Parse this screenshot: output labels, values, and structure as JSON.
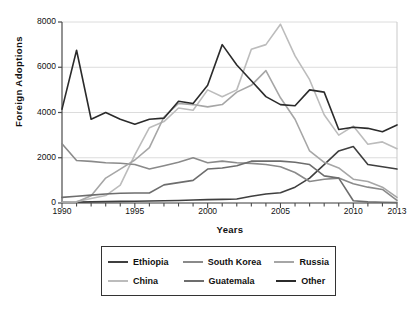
{
  "chart_data": {
    "type": "line",
    "title": "",
    "xlabel": "Years",
    "ylabel": "Foreign  Adoptions",
    "xlim": [
      1990,
      2013
    ],
    "ylim": [
      0,
      8000
    ],
    "ytick_values": [
      0,
      2000,
      4000,
      6000,
      8000
    ],
    "ytick_labels": [
      "0",
      "2000",
      "4000",
      "6000",
      "8000"
    ],
    "xtick_values": [
      1990,
      1995,
      2000,
      2005,
      2010,
      2013
    ],
    "xtick_labels": [
      "1990",
      "1995",
      "2000",
      "2005",
      "2010",
      "2013"
    ],
    "minor_xticks_every": 1,
    "grid": "horizontal",
    "legend_position": "below-center",
    "legend_columns": 3,
    "x": [
      1990,
      1991,
      1992,
      1993,
      1994,
      1995,
      1996,
      1997,
      1998,
      1999,
      2000,
      2001,
      2002,
      2003,
      2004,
      2005,
      2006,
      2007,
      2008,
      2009,
      2010,
      2011,
      2012,
      2013
    ],
    "series": [
      {
        "name": "Ethiopia",
        "color": "#3f3f3f",
        "values": [
          30,
          40,
          50,
          60,
          70,
          80,
          90,
          100,
          110,
          130,
          150,
          160,
          180,
          300,
          400,
          450,
          700,
          1100,
          1700,
          2300,
          2500,
          1700,
          1600,
          1500
        ]
      },
      {
        "name": "China",
        "color": "#bcbcbc",
        "values": [
          30,
          60,
          200,
          330,
          790,
          2130,
          3330,
          3600,
          4200,
          4100,
          5000,
          4700,
          5000,
          6800,
          7000,
          7900,
          6500,
          5450,
          3900,
          3000,
          3400,
          2600,
          2700,
          2400
        ]
      },
      {
        "name": "South Korea",
        "color": "#8a8a8a",
        "values": [
          2620,
          1880,
          1840,
          1780,
          1760,
          1700,
          1500,
          1650,
          1800,
          2000,
          1780,
          1850,
          1780,
          1750,
          1700,
          1600,
          1350,
          950,
          1050,
          1100,
          850,
          700,
          600,
          120
        ]
      },
      {
        "name": "Russia",
        "color": "#a6a6a6",
        "values": [
          30,
          40,
          320,
          1100,
          1500,
          1900,
          2450,
          3800,
          4400,
          4350,
          4250,
          4350,
          4900,
          5200,
          5850,
          4650,
          3700,
          2300,
          1800,
          1550,
          1050,
          950,
          700,
          250
        ]
      },
      {
        "name": "Guatemala",
        "color": "#6d6d6d",
        "values": [
          250,
          300,
          350,
          400,
          430,
          440,
          440,
          800,
          900,
          1000,
          1500,
          1550,
          1650,
          1850,
          1850,
          1850,
          1800,
          1700,
          1200,
          1100,
          100,
          50,
          30,
          20
        ]
      },
      {
        "name": "Other",
        "color": "#2b2b2b",
        "values": [
          4150,
          6750,
          3700,
          4000,
          3700,
          3480,
          3700,
          3750,
          4500,
          4400,
          5200,
          7000,
          6100,
          5400,
          4700,
          4350,
          4300,
          5000,
          4900,
          3250,
          3350,
          3300,
          3150,
          3450
        ]
      }
    ]
  },
  "legend": {
    "rows": [
      [
        {
          "label": "Ethiopia",
          "color": "#3f3f3f"
        },
        {
          "label": "South Korea",
          "color": "#8a8a8a"
        },
        {
          "label": "Russia",
          "color": "#a6a6a6"
        }
      ],
      [
        {
          "label": "China",
          "color": "#bcbcbc"
        },
        {
          "label": "Guatemala",
          "color": "#6d6d6d"
        },
        {
          "label": "Other",
          "color": "#2b2b2b"
        }
      ]
    ]
  },
  "style": {
    "background": "#ffffff",
    "axis_color": "#4a4a4a",
    "grid_color": "#dcdcdc",
    "text_color": "#111111",
    "legend_border": "#333333"
  }
}
